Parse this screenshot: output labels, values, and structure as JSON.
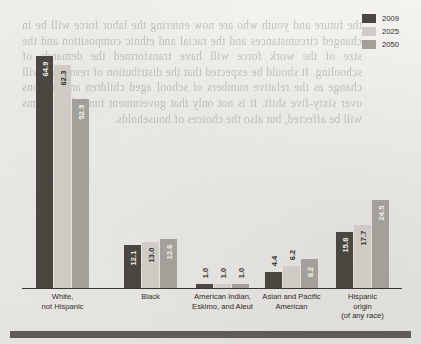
{
  "legend": {
    "items": [
      {
        "label": "2009",
        "color": "#4a4741"
      },
      {
        "label": "2025",
        "color": "#cfccc5"
      },
      {
        "label": "2050",
        "color": "#a3a099"
      }
    ]
  },
  "bleed_text": "the future and youth who are now entering the labor force will be in changed circumstances and the racial and ethnic composition and the size of the work force will have transformed the demands of schooling. It should be expected that the distribution of resources will change as the relative numbers of school aged children and persons over sixty-five shift. It is not only that government funded programs will be affected, but also the choices of households.",
  "chart_data": {
    "type": "bar",
    "title": "",
    "subtitle": "",
    "xlabel": "",
    "ylabel": "",
    "grid": false,
    "legend_position": "top-right",
    "ylim": [
      0,
      70
    ],
    "categories": [
      "White,\nnot Hispanic",
      "Black",
      "American Indian,\nEskimo, and Aleut",
      "Asian and Pacific\nAmerican",
      "Hispanic\norigin\n(of any race)"
    ],
    "series": [
      {
        "name": "2009",
        "color": "#4a4741",
        "values": [
          64.9,
          12.1,
          1.0,
          4.4,
          15.8
        ]
      },
      {
        "name": "2025",
        "color": "#cfccc5",
        "values": [
          62.3,
          13.0,
          1.0,
          6.2,
          17.7
        ]
      },
      {
        "name": "2050",
        "color": "#a3a099",
        "values": [
          52.9,
          13.6,
          1.0,
          8.2,
          24.5
        ]
      }
    ]
  },
  "groups": [
    {
      "label_lines": [
        "White,",
        "not Hispanic"
      ],
      "bars": [
        {
          "series": "2009",
          "value": "64.9"
        },
        {
          "series": "2025",
          "value": "62.3"
        },
        {
          "series": "2050",
          "value": "52.9"
        }
      ]
    },
    {
      "label_lines": [
        "Black"
      ],
      "bars": [
        {
          "series": "2009",
          "value": "12.1"
        },
        {
          "series": "2025",
          "value": "13.0"
        },
        {
          "series": "2050",
          "value": "13.6"
        }
      ]
    },
    {
      "label_lines": [
        "American Indian,",
        "Eskimo, and Aleut"
      ],
      "bars": [
        {
          "series": "2009",
          "value": "1.0"
        },
        {
          "series": "2025",
          "value": "1.0"
        },
        {
          "series": "2050",
          "value": "1.0"
        }
      ]
    },
    {
      "label_lines": [
        "Asian and Pacific",
        "American"
      ],
      "bars": [
        {
          "series": "2009",
          "value": "4.4"
        },
        {
          "series": "2025",
          "value": "6.2"
        },
        {
          "series": "2050",
          "value": "8.2"
        }
      ]
    },
    {
      "label_lines": [
        "Hispanic",
        "origin",
        "(of any race)"
      ],
      "bars": [
        {
          "series": "2009",
          "value": "15.8"
        },
        {
          "series": "2025",
          "value": "17.7"
        },
        {
          "series": "2050",
          "value": "24.5"
        }
      ]
    }
  ]
}
